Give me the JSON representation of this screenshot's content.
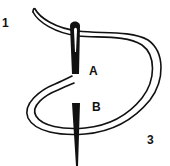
{
  "diagram": {
    "type": "stitch-illustration",
    "labels": {
      "step_1": "1",
      "step_3": "3",
      "point_a": "A",
      "point_b": "B"
    },
    "colors": {
      "ink": "#111111",
      "background": "#ffffff"
    }
  }
}
